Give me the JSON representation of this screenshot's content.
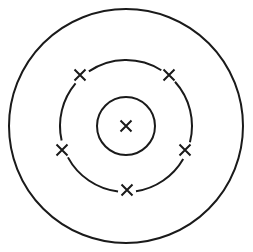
{
  "diagram": {
    "type": "bohr-atom-model",
    "stroke_color": "#1a1a1a",
    "background": "#ffffff",
    "center": [
      126,
      126
    ],
    "shells": [
      {
        "name": "inner-shell",
        "radius": 29,
        "electron_count": 0
      },
      {
        "name": "middle-shell",
        "radius": 66,
        "electron_count": 5
      },
      {
        "name": "outer-shell",
        "radius": 117,
        "electron_count": 0
      }
    ],
    "nucleus_marker": {
      "symbol": "cross",
      "x": 126,
      "y": 126
    },
    "electrons": [
      {
        "shell": "middle-shell",
        "x": 80,
        "y": 75
      },
      {
        "shell": "middle-shell",
        "x": 169,
        "y": 75
      },
      {
        "shell": "middle-shell",
        "x": 62,
        "y": 150
      },
      {
        "shell": "middle-shell",
        "x": 185,
        "y": 150
      },
      {
        "shell": "middle-shell",
        "x": 127,
        "y": 190
      }
    ]
  }
}
